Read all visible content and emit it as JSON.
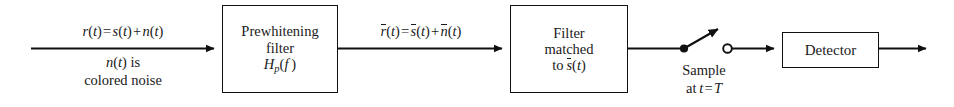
{
  "diagram": {
    "background_color": "#ffffff",
    "line_color": "#101010"
  },
  "input_label": {
    "line1_plain": "r(t) = s(t) + n(t)",
    "line2_plain": "n(t) is",
    "line3_plain": "colored noise"
  },
  "blocks": [
    {
      "name": "prewhitening-filter",
      "line1": "Prewhitening",
      "line2": "filter",
      "line3_plain": "Hp(f )"
    },
    {
      "name": "matched-filter",
      "line1": "Filter",
      "line2": "matched",
      "line3_plain": "to s̅(t)"
    },
    {
      "name": "detector",
      "line1": "Detector"
    }
  ],
  "intermediate_label": {
    "text_plain": "r̅(t) = s̅(t) + n̅(t)"
  },
  "sampler": {
    "line1": "Sample",
    "line2_plain": "at t = T",
    "closed_terminal": "filled-dot",
    "open_terminal": "open-circle"
  }
}
